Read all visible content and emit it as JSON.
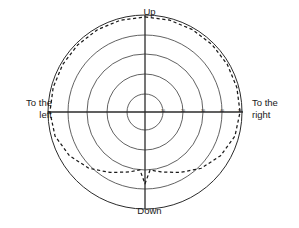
{
  "chart_data": {
    "type": "line",
    "title": "",
    "subtitle": "",
    "xlabel": "",
    "ylabel": "",
    "projection": "polar",
    "grid": true,
    "legend": null,
    "center": {
      "x": 145,
      "y": 112
    },
    "radial_axis": {
      "label": "",
      "unit": "degrees",
      "range": [
        0,
        50
      ],
      "tick_values": [
        10,
        20,
        30,
        40,
        50
      ],
      "tick_labels": [
        "10",
        "20",
        "30",
        "40",
        "50"
      ],
      "tick_label_position": "right-horizontal-axis",
      "ring_radii_px": [
        18,
        38,
        58,
        77,
        97
      ]
    },
    "angular_axis": {
      "direction_labels": [
        "Up",
        "To the right",
        "Down",
        "To the left"
      ],
      "direction_angles_deg": [
        90,
        0,
        270,
        180
      ],
      "crosshair": true
    },
    "rings": {
      "count": 5,
      "style": "solid",
      "color": "#3a3a3a"
    },
    "series": [
      {
        "name": "visual field boundary",
        "style": "dashed",
        "color": "#1a1a1a",
        "closed": true,
        "description": "Boundary curve lying just inside the outermost ring over most angles, with a deep V-shaped notch dipping inward toward the centre at the bottom (Down direction).",
        "points_deg_radius": [
          {
            "angle": 90,
            "radius": 49
          },
          {
            "angle": 75,
            "radius": 49
          },
          {
            "angle": 60,
            "radius": 49
          },
          {
            "angle": 45,
            "radius": 49
          },
          {
            "angle": 30,
            "radius": 49
          },
          {
            "angle": 15,
            "radius": 49
          },
          {
            "angle": 0,
            "radius": 49
          },
          {
            "angle": 345,
            "radius": 48
          },
          {
            "angle": 330,
            "radius": 45
          },
          {
            "angle": 315,
            "radius": 41
          },
          {
            "angle": 300,
            "radius": 36
          },
          {
            "angle": 285,
            "radius": 32
          },
          {
            "angle": 275,
            "radius": 30
          },
          {
            "angle": 270,
            "radius": 37
          },
          {
            "angle": 265,
            "radius": 30
          },
          {
            "angle": 255,
            "radius": 32
          },
          {
            "angle": 240,
            "radius": 36
          },
          {
            "angle": 225,
            "radius": 41
          },
          {
            "angle": 210,
            "radius": 45
          },
          {
            "angle": 195,
            "radius": 48
          },
          {
            "angle": 180,
            "radius": 49
          },
          {
            "angle": 165,
            "radius": 49
          },
          {
            "angle": 150,
            "radius": 49
          },
          {
            "angle": 135,
            "radius": 49
          },
          {
            "angle": 120,
            "radius": 49
          },
          {
            "angle": 105,
            "radius": 49
          }
        ]
      }
    ]
  },
  "labels": {
    "up": "Up",
    "down": "Down",
    "left": "To the\nleft",
    "right": "To the\nright"
  },
  "ticks": {
    "t10": "10",
    "t20": "20",
    "t30": "30",
    "t40": "40",
    "t50": "50"
  },
  "colors": {
    "background": "#ffffff",
    "grid": "#3a3a3a",
    "axis": "#2b2b2b",
    "curve": "#1a1a1a",
    "text": "#1a1a1a"
  }
}
